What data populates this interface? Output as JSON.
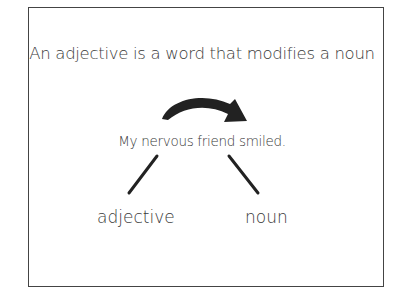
{
  "diagram": {
    "title": "An adjective is a word that modifies a noun",
    "sentence": "My nervous friend smiled.",
    "labels": {
      "adjective": "adjective",
      "noun": "noun"
    },
    "arrow": {
      "direction": "curved-left-to-right",
      "color": "#222222"
    },
    "connectors": [
      {
        "from": "nervous",
        "to": "adjective"
      },
      {
        "from": "friend",
        "to": "noun"
      }
    ]
  }
}
